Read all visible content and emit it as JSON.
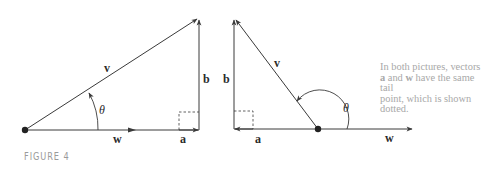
{
  "figure": {
    "label": "FIGURE 4",
    "caption": {
      "line1": "In both pictures, vectors",
      "line2_pre": "",
      "a": "a",
      "line2_mid": " and ",
      "w": "w",
      "line2_post": " have the same tail",
      "line3": "point, which is shown dotted."
    },
    "left_diagram": {
      "labels": {
        "v": "v",
        "w": "w",
        "a": "a",
        "b": "b",
        "theta": "θ"
      },
      "angle_type": "acute"
    },
    "right_diagram": {
      "labels": {
        "v": "v",
        "w": "w",
        "a": "a",
        "b": "b",
        "theta": "θ"
      },
      "angle_type": "obtuse"
    },
    "colors": {
      "stroke": "#3a3a3a",
      "caption_text": "#a8a8a8",
      "figure_label": "#9a9a9a"
    }
  }
}
